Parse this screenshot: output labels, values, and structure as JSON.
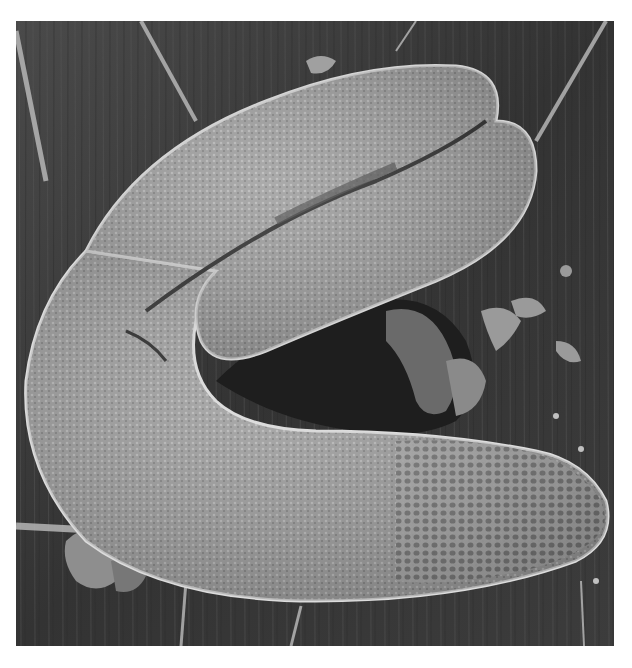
{
  "image": {
    "kind": "scanning electron micrograph",
    "subject": "curved seed / embryo with reticulate cellular surface",
    "colors": {
      "page_background": "#ffffff",
      "substrate_dark": "#2e2e2e",
      "substrate_mid": "#4a4a4a",
      "seed_body": "#9a9a9a",
      "seed_highlight": "#d8d8d8",
      "shadow": "#1a1a1a"
    }
  }
}
